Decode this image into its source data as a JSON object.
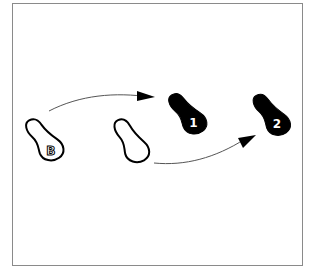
{
  "diagram": {
    "type": "dance-step-footprint-diagram",
    "frame_color": "#8a8a8a",
    "colors": {
      "outline": "#000000",
      "filled_foot": "#000000",
      "empty_foot": "#ffffff",
      "arrow": "#555555",
      "arrowhead": "#000000",
      "label_on_dark": "#ffffff",
      "label_on_light": "#000000"
    },
    "footprints": [
      {
        "id": "start-left",
        "label": "B",
        "style": "outline",
        "x": 40,
        "y": 135
      },
      {
        "id": "start-right",
        "label": "",
        "style": "outline",
        "x": 130,
        "y": 138
      },
      {
        "id": "step-1",
        "label": "1",
        "style": "filled",
        "x": 186,
        "y": 112
      },
      {
        "id": "step-2",
        "label": "2",
        "style": "filled",
        "x": 270,
        "y": 114
      }
    ],
    "arrows": [
      {
        "id": "arrow-b-to-1",
        "from": "start-left",
        "to": "step-1"
      },
      {
        "id": "arrow-right-to-2",
        "from": "start-right",
        "to": "step-2"
      }
    ]
  }
}
